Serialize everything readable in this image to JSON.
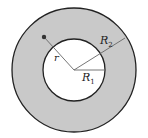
{
  "diagram": {
    "type": "annulus",
    "colors": {
      "ring_fill": "#c9c9c9",
      "hole_fill": "#ffffff",
      "outline": "#222222",
      "radius_line": "#777777"
    },
    "labels": {
      "r": "r",
      "R2_main": "R",
      "R2_sub": "2",
      "R1_main": "R",
      "R1_sub": "1"
    }
  }
}
